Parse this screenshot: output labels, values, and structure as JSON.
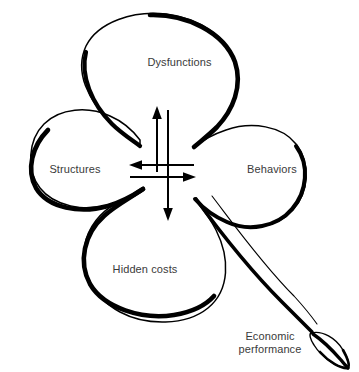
{
  "diagram": {
    "type": "clover-four-lobe-relationship-diagram",
    "background_color": "#ffffff",
    "stroke_color": "#000000",
    "text_color": "#3a3a3a",
    "lobes": [
      {
        "id": "dysfunctions",
        "label": "Dysfunctions",
        "position": "top"
      },
      {
        "id": "structures",
        "label": "Structures",
        "position": "left"
      },
      {
        "id": "behaviors",
        "label": "Behaviors",
        "position": "right"
      },
      {
        "id": "hidden-costs",
        "label": "Hidden costs",
        "position": "bottom"
      }
    ],
    "outcome": {
      "id": "economic-performance",
      "label_line_1": "Economic",
      "label_line_2": "performance",
      "label": "Economic performance",
      "position": "bottom-right-leaf"
    },
    "arrows": [
      {
        "id": "arrow-up",
        "direction": "up",
        "points_to": "dysfunctions"
      },
      {
        "id": "arrow-down",
        "direction": "down",
        "points_to": "hidden-costs"
      },
      {
        "id": "arrow-left",
        "direction": "left",
        "points_to": "structures"
      },
      {
        "id": "arrow-right",
        "direction": "right",
        "points_to": "behaviors"
      }
    ]
  }
}
